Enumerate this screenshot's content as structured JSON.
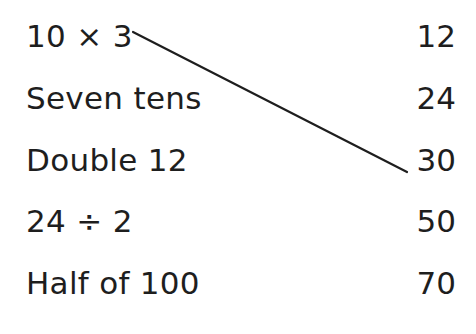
{
  "left_items": [
    {
      "label": "10 × 3"
    },
    {
      "label": "Seven tens"
    },
    {
      "label": "Double 12"
    },
    {
      "label": "24 ÷ 2"
    },
    {
      "label": "Half of 100"
    }
  ],
  "right_items": [
    {
      "label": "12"
    },
    {
      "label": "24"
    },
    {
      "label": "30"
    },
    {
      "label": "50"
    },
    {
      "label": "70"
    }
  ],
  "connections": [
    {
      "from": "10 × 3",
      "to": "30",
      "x1": 133,
      "y1": 32,
      "x2": 407,
      "y2": 172
    }
  ],
  "colors": {
    "text": "#1e1e1e",
    "line": "#1e1e1e",
    "background": "#ffffff"
  }
}
